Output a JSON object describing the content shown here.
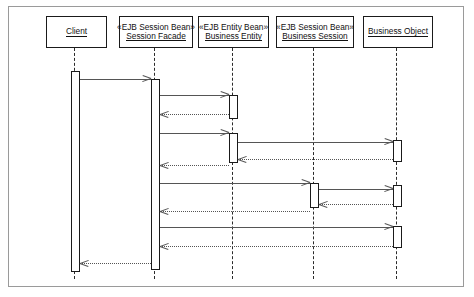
{
  "diagram": {
    "kind": "uml-sequence-diagram",
    "frame": {
      "border_color": "#9a9a9a",
      "background": "#ffffff"
    },
    "line_color": "#555555",
    "box_border_color": "#1a1a1a",
    "lifelines": [
      {
        "id": "client",
        "stereotype": "",
        "name": "Client",
        "x": 75,
        "box": {
          "left": 46,
          "top": 16,
          "width": 61,
          "height": 32
        }
      },
      {
        "id": "session-facade",
        "stereotype": "«EJB Session Bean»",
        "name": "Session Facade",
        "x": 155,
        "box": {
          "left": 119,
          "top": 16,
          "width": 74,
          "height": 32
        }
      },
      {
        "id": "business-entity",
        "stereotype": "«EJB Entity Bean»",
        "name": "Business Entity",
        "x": 233,
        "box": {
          "left": 198,
          "top": 16,
          "width": 71,
          "height": 32
        }
      },
      {
        "id": "business-session",
        "stereotype": "«EJB Session Bean»",
        "name": "Business Session",
        "x": 314,
        "box": {
          "left": 276,
          "top": 16,
          "width": 78,
          "height": 32
        }
      },
      {
        "id": "business-object",
        "stereotype": "",
        "name": "Business Object",
        "x": 397,
        "box": {
          "left": 363,
          "top": 16,
          "width": 70,
          "height": 32
        }
      }
    ],
    "activations": [
      {
        "id": "act-client",
        "lifeline": "client",
        "top": 71,
        "height": 201,
        "width": 9
      },
      {
        "id": "act-facade",
        "lifeline": "session-facade",
        "top": 79,
        "height": 191,
        "width": 9
      },
      {
        "id": "act-entity-1",
        "lifeline": "business-entity",
        "top": 95,
        "height": 24,
        "width": 9
      },
      {
        "id": "act-entity-2",
        "lifeline": "business-entity",
        "top": 133,
        "height": 30,
        "width": 9
      },
      {
        "id": "act-session-1",
        "lifeline": "business-session",
        "top": 183,
        "height": 25,
        "width": 9
      },
      {
        "id": "act-object-1",
        "lifeline": "business-object",
        "top": 140,
        "height": 22,
        "width": 9
      },
      {
        "id": "act-object-2",
        "lifeline": "business-object",
        "top": 185,
        "height": 22,
        "width": 9
      },
      {
        "id": "act-object-3",
        "lifeline": "business-object",
        "top": 226,
        "height": 22,
        "width": 9
      }
    ],
    "messages": [
      {
        "id": "m1",
        "label": "",
        "from": "client",
        "to": "session-facade",
        "y": 79,
        "style": "solid",
        "direction": "right"
      },
      {
        "id": "m2",
        "label": "",
        "from": "session-facade",
        "to": "business-entity",
        "y": 95,
        "style": "solid",
        "direction": "right"
      },
      {
        "id": "m3",
        "label": "",
        "from": "business-entity",
        "to": "session-facade",
        "y": 114,
        "style": "dashed",
        "direction": "left"
      },
      {
        "id": "m4",
        "label": "",
        "from": "session-facade",
        "to": "business-entity",
        "y": 133,
        "style": "solid",
        "direction": "right"
      },
      {
        "id": "m5",
        "label": "",
        "from": "business-entity",
        "to": "business-object",
        "y": 142,
        "style": "solid",
        "direction": "right"
      },
      {
        "id": "m6",
        "label": "",
        "from": "business-object",
        "to": "business-entity",
        "y": 159,
        "style": "dashed",
        "direction": "left"
      },
      {
        "id": "m7",
        "label": "",
        "from": "business-entity",
        "to": "session-facade",
        "y": 165,
        "style": "dashed",
        "direction": "left"
      },
      {
        "id": "m8",
        "label": "",
        "from": "session-facade",
        "to": "business-session",
        "y": 183,
        "style": "solid",
        "direction": "right"
      },
      {
        "id": "m9",
        "label": "",
        "from": "business-session",
        "to": "business-object",
        "y": 189,
        "style": "solid",
        "direction": "right"
      },
      {
        "id": "m10",
        "label": "",
        "from": "business-object",
        "to": "business-session",
        "y": 204,
        "style": "dashed",
        "direction": "left"
      },
      {
        "id": "m11",
        "label": "",
        "from": "business-session",
        "to": "session-facade",
        "y": 211,
        "style": "dashed",
        "direction": "left"
      },
      {
        "id": "m12",
        "label": "",
        "from": "session-facade",
        "to": "business-object",
        "y": 227,
        "style": "solid",
        "direction": "right"
      },
      {
        "id": "m13",
        "label": "",
        "from": "business-object",
        "to": "session-facade",
        "y": 246,
        "style": "dashed",
        "direction": "left"
      },
      {
        "id": "m14",
        "label": "",
        "from": "session-facade",
        "to": "client",
        "y": 263,
        "style": "dashed",
        "direction": "left"
      }
    ]
  }
}
